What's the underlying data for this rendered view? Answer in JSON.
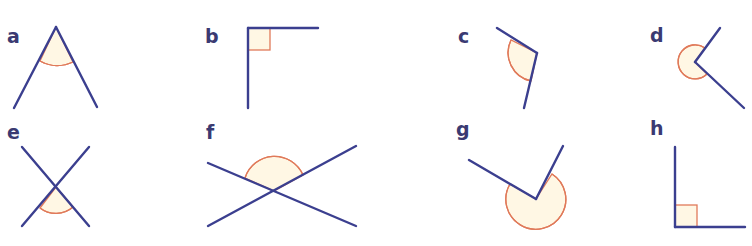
{
  "figure": {
    "colors": {
      "ray": "#3b3f8f",
      "label": "#3a3a72",
      "arc_stroke": "#e07a5a",
      "arc_fill": "#fff7e4"
    },
    "angles": [
      {
        "id": "a",
        "label": "a",
        "type": "acute",
        "marker": "arc"
      },
      {
        "id": "b",
        "label": "b",
        "type": "right",
        "marker": "square"
      },
      {
        "id": "c",
        "label": "c",
        "type": "obtuse",
        "marker": "arc"
      },
      {
        "id": "d",
        "label": "d",
        "type": "reflex",
        "marker": "arc"
      },
      {
        "id": "e",
        "label": "e",
        "type": "acute",
        "marker": "arc"
      },
      {
        "id": "f",
        "label": "f",
        "type": "obtuse",
        "marker": "arc"
      },
      {
        "id": "g",
        "label": "g",
        "type": "reflex",
        "marker": "arc"
      },
      {
        "id": "h",
        "label": "h",
        "type": "right",
        "marker": "square"
      }
    ]
  }
}
